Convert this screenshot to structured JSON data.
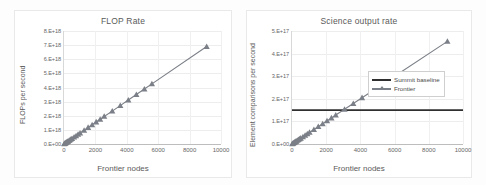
{
  "figure": {
    "background": "#fdfdfd",
    "accent_gray": "#7b7f87",
    "baseline_color": "#2f2f2f"
  },
  "chart_data": [
    {
      "id": "flop-rate",
      "type": "scatter",
      "title": "FLOP Rate",
      "xlabel": "Frontier nodes",
      "ylabel": "FLOPs per second",
      "xlim": [
        0,
        10000
      ],
      "ylim": [
        0,
        8e+18
      ],
      "grid": true,
      "legend_position": "none",
      "xticks": [
        "0",
        "2000",
        "4000",
        "6000",
        "8000",
        "10000"
      ],
      "xtick_values": [
        0,
        2000,
        4000,
        6000,
        8000,
        10000
      ],
      "yticks": [
        "0.E+00",
        "1.E+18",
        "2.E+18",
        "3.E+18",
        "4.E+18",
        "5.E+18",
        "6.E+18",
        "7.E+18",
        "8.E+18"
      ],
      "ytick_values": [
        0,
        1e+18,
        2e+18,
        3e+18,
        4e+18,
        5e+18,
        6e+18,
        7e+18,
        8e+18
      ],
      "series": [
        {
          "name": "Frontier",
          "marker": "triangle",
          "color": "#7b7f87",
          "x": [
            16,
            32,
            64,
            96,
            128,
            160,
            192,
            224,
            256,
            320,
            384,
            448,
            512,
            640,
            768,
            896,
            1024,
            1280,
            1536,
            1792,
            2048,
            2304,
            2560,
            3072,
            3584,
            4096,
            4608,
            5120,
            5600,
            9088
          ],
          "y": [
            1.2e+16,
            2.4e+16,
            4.9e+16,
            7.3e+16,
            9.7e+16,
            1.22e+17,
            1.46e+17,
            1.7e+17,
            1.95e+17,
            2.43e+17,
            2.92e+17,
            3.41e+17,
            3.89e+17,
            4.87e+17,
            5.84e+17,
            6.81e+17,
            7.78e+17,
            9.73e+17,
            1.17e+18,
            1.36e+18,
            1.56e+18,
            1.75e+18,
            1.95e+18,
            2.33e+18,
            2.72e+18,
            3.11e+18,
            3.5e+18,
            3.89e+18,
            4.26e+18,
            6.9e+18
          ]
        }
      ]
    },
    {
      "id": "science-output-rate",
      "type": "scatter",
      "title": "Science output rate",
      "xlabel": "Frontier nodes",
      "ylabel": "Element comparisons per second",
      "xlim": [
        0,
        10000
      ],
      "ylim": [
        0,
        5e+17
      ],
      "grid": true,
      "legend_position": "center-right",
      "xticks": [
        "0",
        "2000",
        "4000",
        "6000",
        "8000",
        "10000"
      ],
      "xtick_values": [
        0,
        2000,
        4000,
        6000,
        8000,
        10000
      ],
      "yticks": [
        "0.E+00",
        "1.E+17",
        "2.E+17",
        "3.E+17",
        "4.E+17",
        "5.E+17"
      ],
      "ytick_values": [
        0,
        1e+17,
        2e+17,
        3e+17,
        4e+17,
        5e+17
      ],
      "series": [
        {
          "name": "Summit baseline",
          "marker": "none",
          "color": "#2f2f2f",
          "x": [
            0,
            10000
          ],
          "y": [
            1.5e+17,
            1.5e+17
          ]
        },
        {
          "name": "Frontier",
          "marker": "triangle",
          "color": "#7b7f87",
          "x": [
            16,
            32,
            64,
            96,
            128,
            160,
            192,
            224,
            256,
            320,
            384,
            448,
            512,
            640,
            768,
            896,
            1024,
            1280,
            1536,
            1792,
            2048,
            2304,
            2560,
            3072,
            3584,
            4096,
            4608,
            5120,
            5600,
            9088
          ],
          "y": [
            800000000000000.0,
            1600000000000000.0,
            3200000000000000.0,
            4800000000000000.0,
            6400000000000000.0,
            8000000000000000.0,
            9600000000000000.0,
            1.12e+16,
            1.28e+16,
            1.6e+16,
            1.92e+16,
            2.24e+16,
            2.56e+16,
            3.2e+16,
            3.84e+16,
            4.48e+16,
            5.12e+16,
            6.4e+16,
            7.68e+16,
            8.96e+16,
            1.024e+17,
            1.152e+17,
            1.28e+17,
            1.536e+17,
            1.792e+17,
            2.048e+17,
            2.304e+17,
            2.56e+17,
            2.8e+17,
            4.54e+17
          ]
        }
      ]
    }
  ]
}
